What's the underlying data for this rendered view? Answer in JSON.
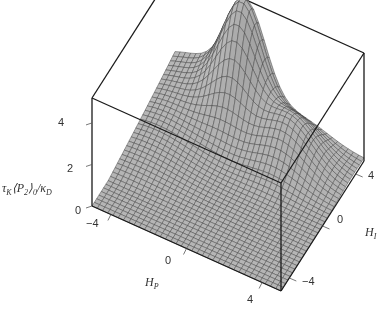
{
  "chart_data": {
    "type": "surface3d",
    "title": "",
    "xlabel": "H_P",
    "ylabel": "H_I",
    "zlabel": "τ_K ⟨P_2⟩_0 / κ_D",
    "x_ticks": [
      "−4",
      "0",
      "4"
    ],
    "y_ticks": [
      "−4",
      "0",
      "4"
    ],
    "z_ticks": [
      "0",
      "2",
      "4"
    ],
    "xlim": [
      -5,
      5
    ],
    "ylim": [
      -5,
      5
    ],
    "zlim": [
      0,
      5.2
    ],
    "grid": true,
    "surface_color": "#b4b4b4",
    "mesh_color": "#4a4a4a",
    "box_color": "#1a1a1a"
  },
  "labels": {
    "z_tick_4": "4",
    "z_tick_2": "2",
    "z_tick_0": "0",
    "x_tick_m4": "−4",
    "x_tick_0": "0",
    "x_tick_4": "4",
    "y_tick_m4": "−4",
    "y_tick_0": "0",
    "y_tick_4": "4",
    "x_axis_H": "H",
    "x_axis_sub": "P",
    "y_axis_H": "H",
    "y_axis_sub": "I",
    "z_tau": "τ",
    "z_tau_sub": "K",
    "z_P": "⟨P",
    "z_P_sub": "2",
    "z_close": "⟩",
    "z_close_sub": "0",
    "z_kappa": "/κ",
    "z_kappa_sub": "D"
  }
}
